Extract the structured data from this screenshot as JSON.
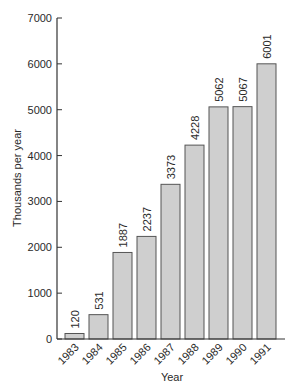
{
  "chart_data": {
    "type": "bar",
    "title": "",
    "xlabel": "Year",
    "ylabel": "Thousands per year",
    "categories": [
      "1983",
      "1984",
      "1985",
      "1986",
      "1987",
      "1988",
      "1989",
      "1990",
      "1991"
    ],
    "values": [
      120,
      531,
      1887,
      2237,
      3373,
      4228,
      5062,
      5067,
      6001
    ],
    "value_labels": [
      "120",
      "531",
      "1887",
      "2237",
      "3373",
      "4228",
      "5062",
      "5067",
      "6001"
    ],
    "ylim": [
      0,
      7000
    ],
    "yticks": [
      0,
      1000,
      2000,
      3000,
      4000,
      5000,
      6000,
      7000
    ],
    "ytick_labels": [
      "0",
      "1000",
      "2000",
      "3000",
      "4000",
      "5000",
      "6000",
      "7000"
    ],
    "grid": false,
    "legend": null,
    "bar_color": "#cfcfcf",
    "bar_edge_color": "#555555",
    "axis_color": "#333333"
  }
}
